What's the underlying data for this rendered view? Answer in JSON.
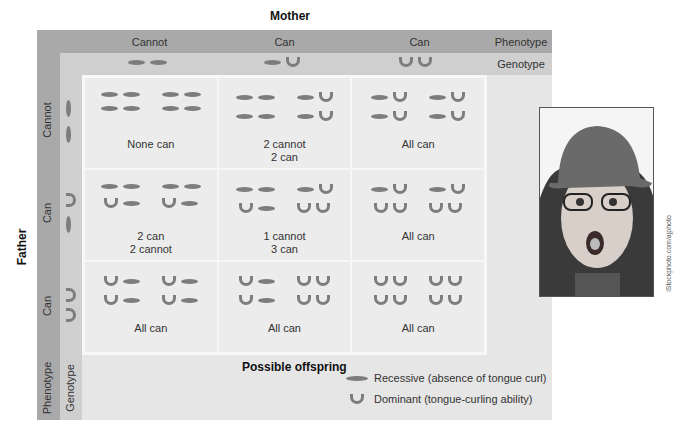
{
  "title_top": "Mother",
  "title_side": "Father",
  "top_axis": {
    "columns": [
      {
        "phenotype": "Cannot",
        "genotype": [
          "recessive",
          "recessive"
        ]
      },
      {
        "phenotype": "Can",
        "genotype": [
          "recessive",
          "dominant"
        ]
      },
      {
        "phenotype": "Can",
        "genotype": [
          "dominant",
          "dominant"
        ]
      }
    ],
    "phenotype_label": "Phenotype",
    "genotype_label": "Genotype"
  },
  "side_axis": {
    "rows": [
      {
        "phenotype": "Cannot",
        "genotype": [
          "recessive",
          "recessive"
        ]
      },
      {
        "phenotype": "Can",
        "genotype": [
          "dominant",
          "recessive"
        ]
      },
      {
        "phenotype": "Can",
        "genotype": [
          "dominant",
          "dominant"
        ]
      }
    ],
    "phenotype_label": "Phenotype",
    "genotype_label": "Genotype"
  },
  "cells": [
    {
      "label": "None can",
      "offspring": [
        [
          "rr",
          "rr"
        ],
        [
          "rr",
          "rr"
        ]
      ]
    },
    {
      "label": "2 cannot\n2 can",
      "offspring": [
        [
          "rr",
          "rd"
        ],
        [
          "rr",
          "rd"
        ]
      ]
    },
    {
      "label": "All can",
      "offspring": [
        [
          "rd",
          "rd"
        ],
        [
          "rd",
          "rd"
        ]
      ]
    },
    {
      "label": "2 can\n2 cannot",
      "offspring": [
        [
          "rr",
          "rr"
        ],
        [
          "dr",
          "dr"
        ]
      ]
    },
    {
      "label": "1 cannot\n3 can",
      "offspring": [
        [
          "rr",
          "rd"
        ],
        [
          "dr",
          "dd"
        ]
      ]
    },
    {
      "label": "All can",
      "offspring": [
        [
          "rd",
          "rd"
        ],
        [
          "dd",
          "dd"
        ]
      ]
    },
    {
      "label": "All can",
      "offspring": [
        [
          "dr",
          "dr"
        ],
        [
          "dr",
          "dr"
        ]
      ]
    },
    {
      "label": "All can",
      "offspring": [
        [
          "dr",
          "dd"
        ],
        [
          "dr",
          "dd"
        ]
      ]
    },
    {
      "label": "All can",
      "offspring": [
        [
          "dd",
          "dd"
        ],
        [
          "dd",
          "dd"
        ]
      ]
    }
  ],
  "offspring_label": "Possible offspring",
  "legend": {
    "recessive": "Recessive (absence of tongue curl)",
    "dominant": "Dominant (tongue-curling ability)"
  },
  "photo_credit": "iStockphoto.com/ajphoto",
  "colors": {
    "band_dark": "#a9a9a9",
    "band_mid": "#cfcfcf",
    "panel": "#e6e6e6",
    "allele": "#7d7d7d"
  }
}
